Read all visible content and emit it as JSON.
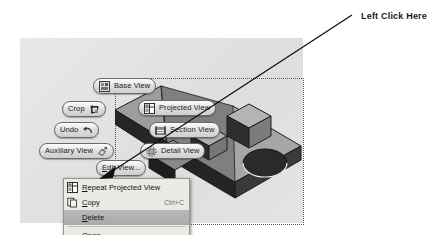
{
  "annotation": {
    "callout_label": "Left Click Here",
    "arrow_color": "#111111"
  },
  "canvas": {
    "background_color": "#e3e3e3",
    "selection_border_style": "dotted",
    "part_model": {
      "name": "isometric-wedge-part",
      "face_color_top": "#9b9b9b",
      "face_color_side": "#6e6e6e",
      "face_color_dark": "#2b2b2b",
      "features": [
        "ramp-wedge",
        "boss-cube-large",
        "boss-cube-small",
        "through-hole"
      ]
    }
  },
  "marking_menu": {
    "name": "drawing-view-marking-menu",
    "items": [
      {
        "id": "base-view",
        "label": "Base View",
        "icon": "base-view-icon",
        "icon_side": "left"
      },
      {
        "id": "projected-view",
        "label": "Projected View",
        "icon": "projected-view-icon",
        "icon_side": "left"
      },
      {
        "id": "section-view",
        "label": "Section View",
        "icon": "section-view-icon",
        "icon_side": "left"
      },
      {
        "id": "detail-view",
        "label": "Detail View",
        "icon": "detail-view-icon",
        "icon_side": "left"
      },
      {
        "id": "crop",
        "label": "Crop",
        "icon": "crop-icon",
        "icon_side": "right"
      },
      {
        "id": "undo",
        "label": "Undo",
        "icon": "undo-icon",
        "icon_side": "right"
      },
      {
        "id": "auxiliary-view",
        "label": "Auxiliary View",
        "icon": "auxiliary-view-icon",
        "icon_side": "right"
      },
      {
        "id": "edit-view",
        "label": "Edit View...",
        "icon": "none",
        "icon_side": "none"
      }
    ]
  },
  "context_menu": {
    "name": "drawing-view-context-menu",
    "highlighted_item": "Delete",
    "items": [
      {
        "id": "repeat-projected-view",
        "label": "Repeat Projected View",
        "mnemonic": "R",
        "accel": "",
        "icon": "repeat-projected-view-icon",
        "enabled": true,
        "highlighted": false
      },
      {
        "id": "copy",
        "label": "Copy",
        "mnemonic": "C",
        "accel": "Ctrl+C",
        "icon": "copy-icon",
        "enabled": true,
        "highlighted": false
      },
      {
        "id": "delete",
        "label": "Delete",
        "mnemonic": "D",
        "accel": "",
        "icon": "none",
        "enabled": true,
        "highlighted": true
      },
      {
        "id": "open",
        "label": "Open",
        "mnemonic": "O",
        "accel": "",
        "icon": "none",
        "enabled": true,
        "highlighted": false
      },
      {
        "id": "update-model",
        "label": "Update Model",
        "mnemonic": "U",
        "accel": "",
        "icon": "update-model-icon",
        "enabled": false,
        "highlighted": false
      }
    ]
  }
}
